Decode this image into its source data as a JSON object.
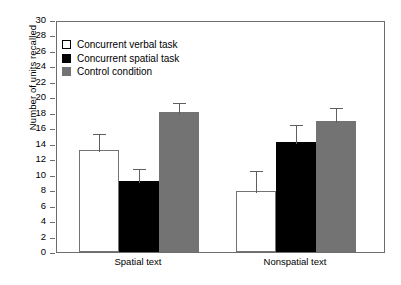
{
  "chart_data": {
    "type": "bar",
    "title": "",
    "xlabel": "",
    "ylabel": "Number of units recalled",
    "ylim": [
      0,
      30
    ],
    "ytick_step": 2,
    "yticks": [
      30,
      28,
      26,
      24,
      22,
      20,
      18,
      16,
      14,
      12,
      10,
      8,
      6,
      4,
      2,
      0
    ],
    "ytick_labels": [
      "30",
      "28",
      "26",
      "24",
      "22",
      "20",
      "18",
      "16",
      "14",
      "12",
      "10",
      "8",
      "6",
      "4",
      "2",
      "0"
    ],
    "categories": [
      "Spatial text",
      "Nonspatial text"
    ],
    "grid": false,
    "legend_position": "upper left",
    "series": [
      {
        "name": "Concurrent verbal task",
        "color": "#ffffff",
        "edge_color": "#737373",
        "values": [
          13.2,
          7.9
        ],
        "errors": [
          2.3,
          2.8
        ]
      },
      {
        "name": "Concurrent spatial task",
        "color": "#000000",
        "edge_color": "#000000",
        "values": [
          9.2,
          14.2
        ],
        "errors": [
          1.8,
          2.5
        ]
      },
      {
        "name": "Control condition",
        "color": "#737373",
        "edge_color": "#737373",
        "values": [
          18.1,
          17.0
        ],
        "errors": [
          1.4,
          1.9
        ]
      }
    ]
  },
  "legend": {
    "items": [
      {
        "label": "Concurrent verbal task",
        "swatch": "white"
      },
      {
        "label": "Concurrent spatial task",
        "swatch": "black"
      },
      {
        "label": "Control condition",
        "swatch": "gray"
      }
    ]
  },
  "axes": {
    "y_label": "Number of units recalled"
  }
}
